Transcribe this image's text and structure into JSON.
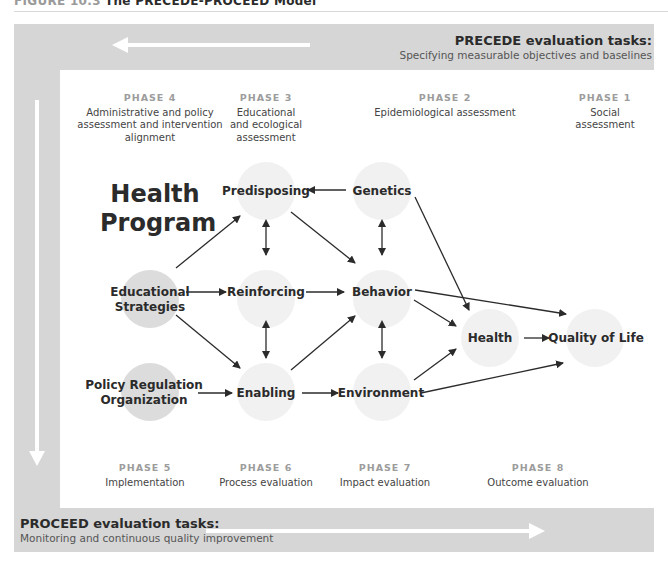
{
  "figure": {
    "label": "FIGURE 10.3",
    "title": "The PRECEDE-PROCEED Model"
  },
  "precede": {
    "title": "PRECEDE evaluation tasks:",
    "subtitle": "Specifying measurable objectives and baselines",
    "arrow_direction": "left"
  },
  "proceed": {
    "title": "PROCEED evaluation tasks:",
    "subtitle": "Monitoring and continuous quality improvement",
    "arrow_direction": "right"
  },
  "phases_top": [
    {
      "label": "PHASE 4",
      "desc": "Administrative and policy assessment and intervention alignment"
    },
    {
      "label": "PHASE 3",
      "desc": "Educational and ecological assessment"
    },
    {
      "label": "PHASE 2",
      "desc": "Epidemiological assessment"
    },
    {
      "label": "PHASE 1",
      "desc": "Social assessment"
    }
  ],
  "phases_bottom": [
    {
      "label": "PHASE 5",
      "desc": "Implementation"
    },
    {
      "label": "PHASE 6",
      "desc": "Process evaluation"
    },
    {
      "label": "PHASE 7",
      "desc": "Impact evaluation"
    },
    {
      "label": "PHASE 8",
      "desc": "Outcome evaluation"
    }
  ],
  "health_program": {
    "line1": "Health",
    "line2": "Program"
  },
  "nodes": {
    "educational_strategies": {
      "line1": "Educational",
      "line2": "Strategies"
    },
    "policy": {
      "line1": "Policy Regulation",
      "line2": "Organization"
    },
    "predisposing": "Predisposing",
    "reinforcing": "Reinforcing",
    "enabling": "Enabling",
    "genetics": "Genetics",
    "behavior": "Behavior",
    "environment": "Environment",
    "health": "Health",
    "quality_of_life": "Quality of Life"
  },
  "colors": {
    "frame": "#d6d6d6",
    "solid_circle": "#dcdcdc",
    "faint_circle": "#f1f1f1",
    "arrow": "#2b2b2b",
    "phase_label": "#9c9c9c"
  }
}
